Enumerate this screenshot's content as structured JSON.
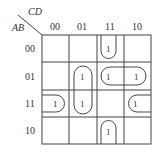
{
  "kmap": {
    "row_var": "AB",
    "col_var": "CD",
    "col_labels": [
      "00",
      "01",
      "11",
      "10"
    ],
    "row_labels": [
      "00",
      "01",
      "11",
      "10"
    ],
    "cells": [
      [
        "",
        "",
        "1",
        ""
      ],
      [
        "",
        "1",
        "1",
        "1"
      ],
      [
        "1",
        "1",
        "",
        "1"
      ],
      [
        "",
        "",
        "1",
        ""
      ]
    ],
    "ones": [
      {
        "row": 0,
        "col": 2,
        "value": "1"
      },
      {
        "row": 1,
        "col": 1,
        "value": "1"
      },
      {
        "row": 1,
        "col": 2,
        "value": "1"
      },
      {
        "row": 1,
        "col": 3,
        "value": "1"
      },
      {
        "row": 2,
        "col": 0,
        "value": "1"
      },
      {
        "row": 2,
        "col": 1,
        "value": "1"
      },
      {
        "row": 2,
        "col": 3,
        "value": "1"
      },
      {
        "row": 3,
        "col": 2,
        "value": "1"
      }
    ],
    "groups": [
      {
        "name": "col11-wrap",
        "cells": [
          [
            0,
            2
          ],
          [
            3,
            2
          ]
        ],
        "description": "wrap-around vertical group in column 11 (rows 00 and 10)"
      },
      {
        "name": "col01-pair",
        "cells": [
          [
            1,
            1
          ],
          [
            2,
            1
          ]
        ],
        "description": "vertical pair in column 01 (rows 01 and 11)"
      },
      {
        "name": "row01-pair",
        "cells": [
          [
            1,
            2
          ],
          [
            1,
            3
          ]
        ],
        "description": "horizontal pair in row 01 (columns 11 and 10)"
      },
      {
        "name": "row11-wrap",
        "cells": [
          [
            2,
            0
          ],
          [
            2,
            3
          ]
        ],
        "description": "wrap-around horizontal group in row 11 (columns 00 and 10)"
      }
    ]
  }
}
